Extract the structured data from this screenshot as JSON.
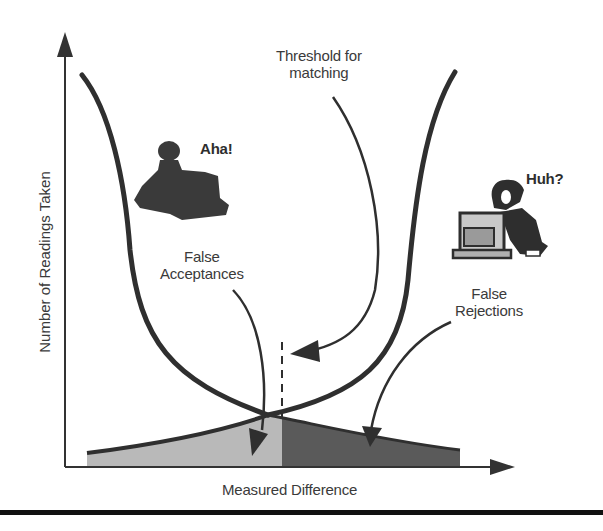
{
  "diagram": {
    "y_axis_label": "Number of Readings Taken",
    "x_axis_label": "Measured Difference",
    "annotations": {
      "threshold": [
        "Threshold for",
        "matching"
      ],
      "false_acceptances": [
        "False",
        "Acceptances"
      ],
      "false_rejections": [
        "False",
        "Rejections"
      ],
      "aha": "Aha!",
      "huh": "Huh?"
    },
    "figures": {
      "left_person": "person-at-computer-silhouette-icon",
      "right_person": "person-at-computer-icon"
    },
    "colors": {
      "curve": "#2f2f2f",
      "false_acceptance_fill": "#b9b9b9",
      "false_rejection_fill": "#5a5a5a",
      "axis": "#333333",
      "rule": "#111111"
    }
  }
}
